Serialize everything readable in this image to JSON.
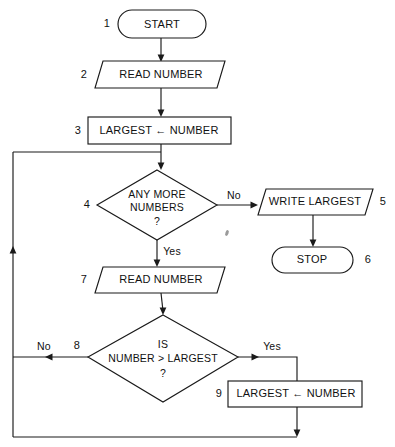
{
  "diagram": {
    "background_color": "#ffffff",
    "line_color": "#1a1a1a",
    "text_color": "#111111"
  },
  "nodes": [
    {
      "id": "start",
      "number": "1",
      "shape": "terminator",
      "label": "START"
    },
    {
      "id": "read_number_1",
      "number": "2",
      "shape": "parallelogram",
      "label": "READ NUMBER"
    },
    {
      "id": "assign_largest_1",
      "number": "3",
      "shape": "rectangle",
      "label": "LARGEST ← NUMBER"
    },
    {
      "id": "any_more_numbers",
      "number": "4",
      "shape": "diamond",
      "label_line1": "ANY MORE",
      "label_line2": "NUMBERS",
      "label_line3": "?"
    },
    {
      "id": "write_largest",
      "number": "5",
      "shape": "parallelogram",
      "label": "WRITE LARGEST"
    },
    {
      "id": "stop",
      "number": "6",
      "shape": "terminator",
      "label": "STOP"
    },
    {
      "id": "read_number_2",
      "number": "7",
      "shape": "parallelogram",
      "label": "READ NUMBER"
    },
    {
      "id": "is_number_greater",
      "number": "8",
      "shape": "diamond",
      "label_line1": "IS",
      "label_line2": "NUMBER > LARGEST",
      "label_line3": "?"
    },
    {
      "id": "assign_largest_2",
      "number": "9",
      "shape": "rectangle",
      "label": "LARGEST ← NUMBER"
    }
  ],
  "edge_labels": {
    "decision4_no": "No",
    "decision4_yes": "Yes",
    "decision8_no": "No",
    "decision8_yes": "Yes"
  }
}
